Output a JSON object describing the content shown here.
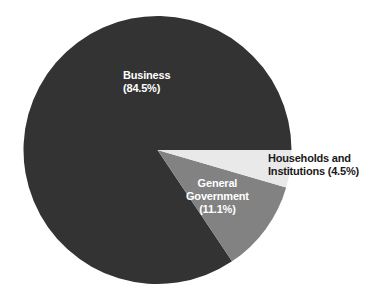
{
  "background_color": "#ffffff",
  "chart_data": {
    "type": "pie",
    "title": "",
    "subtitle": "",
    "xlabel": "",
    "ylabel": "",
    "grid": false,
    "legend_position": "none",
    "label_format": "name (percent%)",
    "start_angle_deg": 0,
    "direction": "clockwise",
    "center": {
      "x": 157.5,
      "y": 150
    },
    "radius": 134,
    "categories": [
      "Business",
      "General Government",
      "Households and Institutions"
    ],
    "values": [
      84.5,
      11.1,
      4.5
    ],
    "units": "percent",
    "colors": [
      "#333333",
      "#828282",
      "#e9e9e9"
    ],
    "slices": [
      {
        "name": "Business",
        "percent": 84.5,
        "percent_text": "(84.5%)",
        "color": "#333333",
        "label_color": "#ffffff",
        "start_deg": 56.2,
        "end_deg": 360,
        "label_placement": "inside"
      },
      {
        "name": "General Government",
        "percent": 11.1,
        "percent_text": "(11.1%)",
        "color": "#828282",
        "label_color": "#ffffff",
        "start_deg": 16.2,
        "end_deg": 56.2,
        "label_placement": "inside"
      },
      {
        "name": "Households and Institutions",
        "percent": 4.5,
        "percent_text": "(4.5%)",
        "color": "#e9e9e9",
        "label_color": "#1a1a1a",
        "start_deg": 0,
        "end_deg": 16.2,
        "label_placement": "outside"
      }
    ]
  },
  "labels": {
    "business": {
      "name": "Business",
      "percent_text": "(84.5%)"
    },
    "general_government": {
      "line1": "General",
      "line2": "Government",
      "percent_text": "(11.1%)"
    },
    "households": {
      "line1": "Households and",
      "line2": "Institutions (4.5%)"
    }
  }
}
